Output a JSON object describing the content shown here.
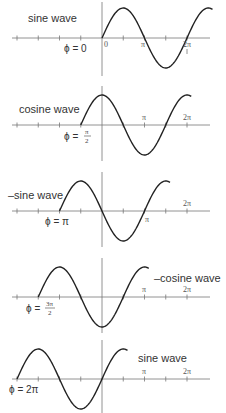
{
  "geometry": {
    "origin_x": 102,
    "pi_px": 42.5,
    "amplitude_px": 30,
    "axis_x_start": 12,
    "axis_x_end": 210,
    "tick_spacing_px": 21.25,
    "curve_span_pi": 2.6
  },
  "panels": [
    {
      "wave_label": "sine wave",
      "phi_label": "ϕ = 0",
      "phi_value": 0,
      "axis_y": 38,
      "ticks": [
        {
          "label": "0",
          "x_pi": 0
        },
        {
          "label": "π",
          "x_pi": 1
        },
        {
          "label": "2π",
          "x_pi": 2
        }
      ]
    },
    {
      "wave_label": "cosine wave",
      "phi_label": "ϕ = π/2",
      "phi_num": "π",
      "phi_den": "2",
      "phi_value": 0.5,
      "axis_y": 125,
      "ticks": [
        {
          "label": "π",
          "x_pi": 1
        },
        {
          "label": "2π",
          "x_pi": 2
        }
      ]
    },
    {
      "wave_label": "–sine wave",
      "phi_label": "ϕ = π",
      "phi_value": 1,
      "axis_y": 211,
      "ticks": [
        {
          "label": "π",
          "x_pi": 1
        },
        {
          "label": "2π",
          "x_pi": 2
        }
      ]
    },
    {
      "wave_label": "–cosine wave",
      "phi_label": "ϕ = 3π/2",
      "phi_num": "3π",
      "phi_den": "2",
      "phi_value": 1.5,
      "axis_y": 297,
      "ticks": [
        {
          "label": "π",
          "x_pi": 1
        },
        {
          "label": "2π",
          "x_pi": 2
        }
      ]
    },
    {
      "wave_label": "sine wave",
      "phi_label": "ϕ = 2π",
      "phi_value": 2,
      "axis_y": 379,
      "ticks": [
        {
          "label": "π",
          "x_pi": 1
        },
        {
          "label": "2π",
          "x_pi": 2
        }
      ]
    }
  ]
}
